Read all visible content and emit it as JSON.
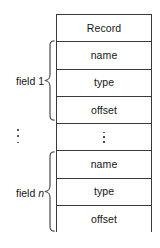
{
  "diagram": {
    "record_table": {
      "rows": [
        {
          "label": "Record",
          "kind": "header"
        },
        {
          "label": "name",
          "kind": "entry"
        },
        {
          "label": "type",
          "kind": "entry"
        },
        {
          "label": "offset",
          "kind": "entry"
        },
        {
          "label": "⋮",
          "kind": "ellipsis"
        },
        {
          "label": "name",
          "kind": "entry"
        },
        {
          "label": "type",
          "kind": "entry"
        },
        {
          "label": "offset",
          "kind": "entry"
        }
      ]
    },
    "annotations": {
      "field_first": {
        "prefix": "field ",
        "index": "1",
        "index_italic": false
      },
      "field_last": {
        "prefix": "field ",
        "index": "n",
        "index_italic": true
      },
      "gap_ellipsis": "⋮"
    },
    "colors": {
      "stroke": "#3a3a3a",
      "text": "#151515",
      "background": "#ffffff",
      "dot": "#5a5a5a"
    }
  }
}
